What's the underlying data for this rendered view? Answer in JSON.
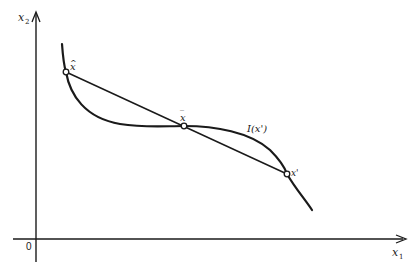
{
  "diagram": {
    "axes": {
      "x_label": "x",
      "x_label_subscript": "1",
      "y_label": "x",
      "y_label_subscript": "2",
      "origin_label": "0"
    },
    "points": [
      {
        "id": "x-hat",
        "label": "x",
        "accent": "^",
        "x": 66,
        "y": 72
      },
      {
        "id": "x-bar",
        "label": "x",
        "accent": "‾",
        "x": 184,
        "y": 126
      },
      {
        "id": "x-prime",
        "label": "x'",
        "x": 287,
        "y": 174
      }
    ],
    "curve_label": "I(x')",
    "colors": {
      "ink": "#1a1a1a",
      "background": "#ffffff"
    }
  }
}
